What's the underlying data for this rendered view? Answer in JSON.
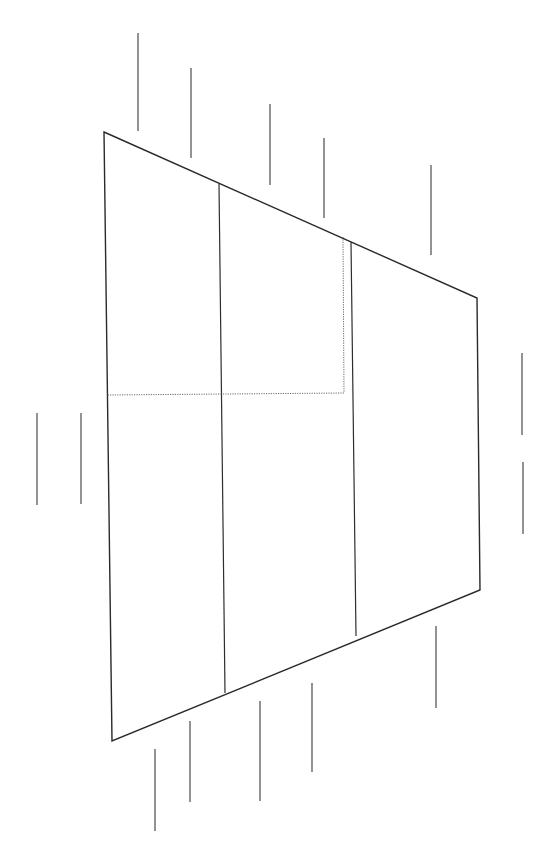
{
  "diagram": {
    "type": "line-drawing",
    "canvas": {
      "width": 556,
      "height": 862,
      "background": "#ffffff"
    },
    "colors": {
      "outline": "#2a2a2a",
      "divider": "#2e2e2e",
      "dotted": "#6a6a6a",
      "tick": "#3a3a3a"
    },
    "trapezoid": {
      "points": [
        [
          104,
          132
        ],
        [
          477,
          298
        ],
        [
          480,
          590
        ],
        [
          112,
          741
        ]
      ]
    },
    "dividers": [
      {
        "x1": 219,
        "y1": 184,
        "x2": 225,
        "y2": 693
      },
      {
        "x1": 351,
        "y1": 242,
        "x2": 356,
        "y2": 636
      }
    ],
    "dotted_rect": {
      "points": [
        [
          343,
          237
        ],
        [
          344,
          393
        ],
        [
          107,
          395
        ]
      ]
    },
    "ticks": {
      "top": [
        {
          "x": 138,
          "y1": 33,
          "y2": 131
        },
        {
          "x": 191,
          "y1": 68,
          "y2": 158
        },
        {
          "x": 270,
          "y1": 104,
          "y2": 185
        },
        {
          "x": 324,
          "y1": 138,
          "y2": 218
        },
        {
          "x": 431,
          "y1": 165,
          "y2": 255
        }
      ],
      "left": [
        {
          "x": 37,
          "y1": 413,
          "y2": 505
        },
        {
          "x": 81,
          "y1": 413,
          "y2": 504
        }
      ],
      "right": [
        {
          "x": 522,
          "y1": 353,
          "y2": 435
        },
        {
          "x": 523,
          "y1": 462,
          "y2": 534
        }
      ],
      "bottom": [
        {
          "x": 155,
          "y1": 749,
          "y2": 831
        },
        {
          "x": 190,
          "y1": 721,
          "y2": 802
        },
        {
          "x": 260,
          "y1": 701,
          "y2": 801
        },
        {
          "x": 312,
          "y1": 683,
          "y2": 772
        },
        {
          "x": 436,
          "y1": 626,
          "y2": 708
        }
      ]
    }
  }
}
